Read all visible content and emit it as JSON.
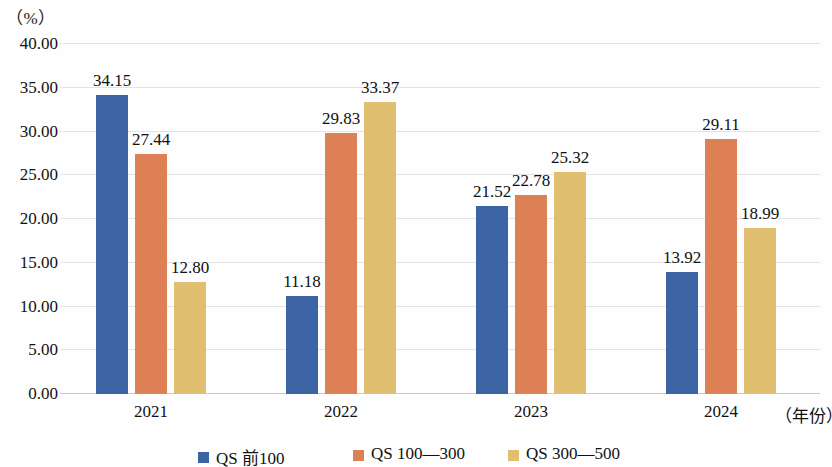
{
  "chart_data": {
    "type": "bar",
    "title": "",
    "subtitle": "",
    "xlabel": "（年份）",
    "ylabel": "（%）",
    "categories": [
      "2021",
      "2022",
      "2023",
      "2024"
    ],
    "series": [
      {
        "name": "QS 前100",
        "color": "#3c64a5",
        "values": [
          34.15,
          11.18,
          21.52,
          13.92
        ]
      },
      {
        "name": "QS 100—300",
        "color": "#dd8055",
        "values": [
          27.44,
          29.83,
          22.78,
          29.11
        ]
      },
      {
        "name": "QS 300—500",
        "color": "#e0c070",
        "values": [
          12.8,
          33.37,
          25.32,
          18.99
        ]
      }
    ],
    "value_labels": [
      [
        "34.15",
        "27.44",
        "12.80"
      ],
      [
        "11.18",
        "29.83",
        "33.37"
      ],
      [
        "21.52",
        "22.78",
        "25.32"
      ],
      [
        "13.92",
        "29.11",
        "18.99"
      ]
    ],
    "ylim": [
      0,
      40
    ],
    "ytick_step": 5,
    "ytick_labels": [
      "40.00",
      "35.00",
      "30.00",
      "25.00",
      "20.00",
      "15.00",
      "10.00",
      "5.00",
      "0.00"
    ],
    "ytick_values": [
      40,
      35,
      30,
      25,
      20,
      15,
      10,
      5,
      0
    ],
    "grid": true,
    "grid_color": "#e3e3e3",
    "legend_position": "bottom"
  },
  "axes": {
    "y_unit": "（%）",
    "x_unit": "（年份）"
  },
  "legend": {
    "items": [
      {
        "label": "QS 前100",
        "color": "#3c64a5"
      },
      {
        "label": "QS 100—300",
        "color": "#dd8055"
      },
      {
        "label": "QS 300—500",
        "color": "#e0c070"
      }
    ]
  }
}
